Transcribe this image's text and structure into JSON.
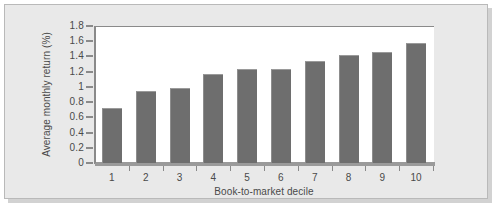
{
  "chart_data": {
    "type": "bar",
    "title": "",
    "xlabel": "Book-to-market decile",
    "ylabel": "Average monthly return (%)",
    "categories": [
      "1",
      "2",
      "3",
      "4",
      "5",
      "6",
      "7",
      "8",
      "9",
      "10"
    ],
    "values": [
      0.72,
      0.95,
      0.99,
      1.17,
      1.23,
      1.23,
      1.34,
      1.42,
      1.46,
      1.58
    ],
    "ylim": [
      0,
      1.8
    ],
    "ytick_labels": [
      "0",
      "0.2",
      "0.4",
      "0.6",
      "0.8",
      "1",
      "1.2",
      "1.4",
      "1.6",
      "1.8"
    ],
    "ytick_values": [
      0,
      0.2,
      0.4,
      0.6,
      0.8,
      1,
      1.2,
      1.4,
      1.6,
      1.8
    ],
    "grid": false,
    "legend": null,
    "series_color": "#6e6e6e",
    "panel_color": "#ffffff",
    "background_color": "#e9e9e9",
    "axis_color": "#8a8a8a",
    "text_color": "#4a4a4a"
  }
}
